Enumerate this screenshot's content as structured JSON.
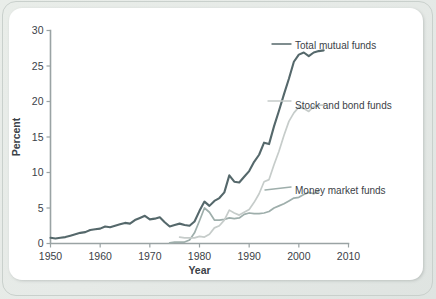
{
  "figure": {
    "background_color": "#e8ece8",
    "card_color": "#ffffff"
  },
  "chart_data": {
    "type": "line",
    "title": "",
    "subtitle": "",
    "xlabel": "Year",
    "ylabel": "Percent",
    "xlim": [
      1950,
      2010
    ],
    "ylim": [
      0,
      30
    ],
    "xticks": [
      1950,
      1960,
      1970,
      1980,
      1990,
      2000,
      2010
    ],
    "xticklabels": [
      "1950",
      "1960",
      "1970",
      "1980",
      "1990",
      "2000",
      "2010"
    ],
    "yticks": [
      0,
      5,
      10,
      15,
      20,
      25,
      30
    ],
    "yticklabels": [
      "0",
      "5",
      "10",
      "15",
      "20",
      "25",
      "30"
    ],
    "grid": false,
    "legend_position": "right-inline-labels",
    "annotations": [],
    "series": [
      {
        "name": "Total mutual funds",
        "color": "#55686b",
        "label_x": 2005,
        "label_y": 27.2,
        "x": [
          1950,
          1951,
          1952,
          1953,
          1954,
          1955,
          1956,
          1957,
          1958,
          1959,
          1960,
          1961,
          1962,
          1963,
          1964,
          1965,
          1966,
          1967,
          1968,
          1969,
          1970,
          1971,
          1972,
          1973,
          1974,
          1975,
          1976,
          1977,
          1978,
          1979,
          1980,
          1981,
          1982,
          1983,
          1984,
          1985,
          1986,
          1987,
          1988,
          1989,
          1990,
          1991,
          1992,
          1993,
          1994,
          1995,
          1996,
          1997,
          1998,
          1999,
          2000,
          2001,
          2002,
          2003,
          2004,
          2005
        ],
        "values": [
          0.8,
          0.7,
          0.8,
          0.9,
          1.1,
          1.3,
          1.5,
          1.6,
          1.9,
          2.0,
          2.1,
          2.4,
          2.3,
          2.5,
          2.7,
          2.9,
          2.8,
          3.3,
          3.6,
          3.9,
          3.4,
          3.5,
          3.7,
          3.0,
          2.4,
          2.6,
          2.8,
          2.6,
          2.5,
          3.1,
          4.6,
          5.9,
          5.3,
          6.0,
          6.4,
          7.2,
          9.6,
          8.7,
          8.6,
          9.4,
          10.2,
          11.5,
          12.5,
          14.2,
          14.0,
          16.5,
          18.7,
          21.0,
          23.2,
          25.6,
          26.6,
          26.9,
          26.4,
          26.9,
          27.1,
          27.2
        ]
      },
      {
        "name": "Stock and bond funds",
        "color": "#c6ccca",
        "label_x": 2005,
        "label_y": 19.6,
        "x": [
          1976,
          1977,
          1978,
          1979,
          1980,
          1981,
          1982,
          1983,
          1984,
          1985,
          1986,
          1987,
          1988,
          1989,
          1990,
          1991,
          1992,
          1993,
          1994,
          1995,
          1996,
          1997,
          1998,
          1999,
          2000,
          2001,
          2002,
          2003,
          2004,
          2005
        ],
        "values": [
          0.9,
          0.8,
          0.8,
          0.8,
          1.0,
          0.9,
          1.3,
          2.2,
          2.5,
          3.3,
          4.7,
          4.3,
          4.0,
          4.4,
          4.8,
          5.8,
          7.0,
          8.7,
          9.0,
          11.1,
          13.0,
          15.2,
          17.2,
          18.4,
          19.2,
          19.0,
          18.6,
          19.3,
          19.5,
          19.5
        ]
      },
      {
        "name": "Money market funds",
        "color": "#9eaeab",
        "label_x": 2005,
        "label_y": 7.4,
        "x": [
          1974,
          1975,
          1976,
          1977,
          1978,
          1979,
          1980,
          1981,
          1982,
          1983,
          1984,
          1985,
          1986,
          1987,
          1988,
          1989,
          1990,
          1991,
          1992,
          1993,
          1994,
          1995,
          1996,
          1997,
          1998,
          1999,
          2000,
          2001,
          2002,
          2003,
          2004
        ],
        "values": [
          0.1,
          0.2,
          0.2,
          0.2,
          0.5,
          1.5,
          3.2,
          5.0,
          4.4,
          3.3,
          3.3,
          3.4,
          3.6,
          3.5,
          3.6,
          4.1,
          4.3,
          4.2,
          4.2,
          4.3,
          4.5,
          5.0,
          5.3,
          5.6,
          6.0,
          6.4,
          6.5,
          6.9,
          7.2,
          7.0,
          7.4
        ]
      }
    ]
  }
}
